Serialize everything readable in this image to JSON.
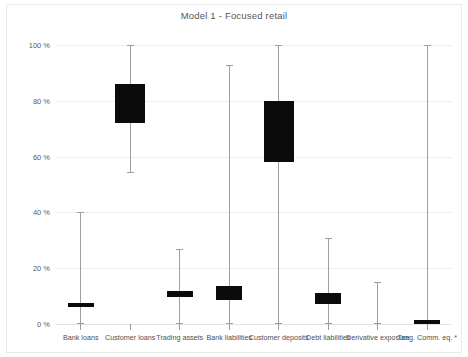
{
  "chart": {
    "title": "Model 1  -  Focused retail",
    "footnote_marker": "*"
  },
  "chart_data": {
    "type": "bar",
    "title": "Model 1  -  Focused retail",
    "xlabel": "",
    "ylabel": "",
    "ylim": [
      0,
      100
    ],
    "yunit": "%",
    "grid": true,
    "legend": null,
    "ytick_labels": [
      "0 %",
      "20 %",
      "40 %",
      "60 %",
      "80 %",
      "100 %"
    ],
    "ytick_values": [
      0,
      20,
      40,
      60,
      80,
      100
    ],
    "categories": [
      "Bank loans",
      "Customer loans",
      "Trading assets",
      "Bank liabilities",
      "Customer deposits",
      "Debt liabilities",
      "Derivative exposure",
      "Tang. Comm. eq. *"
    ],
    "series": [
      {
        "name": "range_low",
        "values": [
          0,
          54,
          0,
          0,
          0,
          0,
          0,
          0
        ]
      },
      {
        "name": "box_low",
        "values": [
          6,
          72,
          9.5,
          8.5,
          58,
          7,
          null,
          0.5
        ]
      },
      {
        "name": "box_high",
        "values": [
          7.5,
          86,
          12,
          13.5,
          80,
          11,
          null,
          1.5
        ]
      },
      {
        "name": "range_high",
        "values": [
          40,
          100,
          27,
          93,
          100,
          31,
          15,
          100
        ]
      }
    ]
  },
  "plot": {
    "bars": [
      {
        "label": "Bank loans",
        "low": 0,
        "q1": 6,
        "q3": 7.5,
        "high": 40
      },
      {
        "label": "Customer loans",
        "low": 54,
        "q1": 72,
        "q3": 86,
        "high": 100
      },
      {
        "label": "Trading assets",
        "low": 0,
        "q1": 9.5,
        "q3": 12,
        "high": 27
      },
      {
        "label": "Bank liabilities",
        "low": 0,
        "q1": 8.5,
        "q3": 13.5,
        "high": 93
      },
      {
        "label": "Customer deposits",
        "low": 0,
        "q1": 58,
        "q3": 80,
        "high": 100
      },
      {
        "label": "Debt liabilities",
        "low": 0,
        "q1": 7,
        "q3": 11,
        "high": 31
      },
      {
        "label": "Derivative exposure",
        "low": 0,
        "q1": 0,
        "q3": 0,
        "high": 15
      },
      {
        "label": "Tang. Comm. eq. *",
        "low": 0,
        "q1": 0.5,
        "q3": 1.5,
        "high": 100
      }
    ]
  },
  "colors": {
    "box_fill": "#0b0b0b",
    "whisker": "#9e9e9e",
    "gridline": "#efefef",
    "text": "#4f4f4f"
  }
}
